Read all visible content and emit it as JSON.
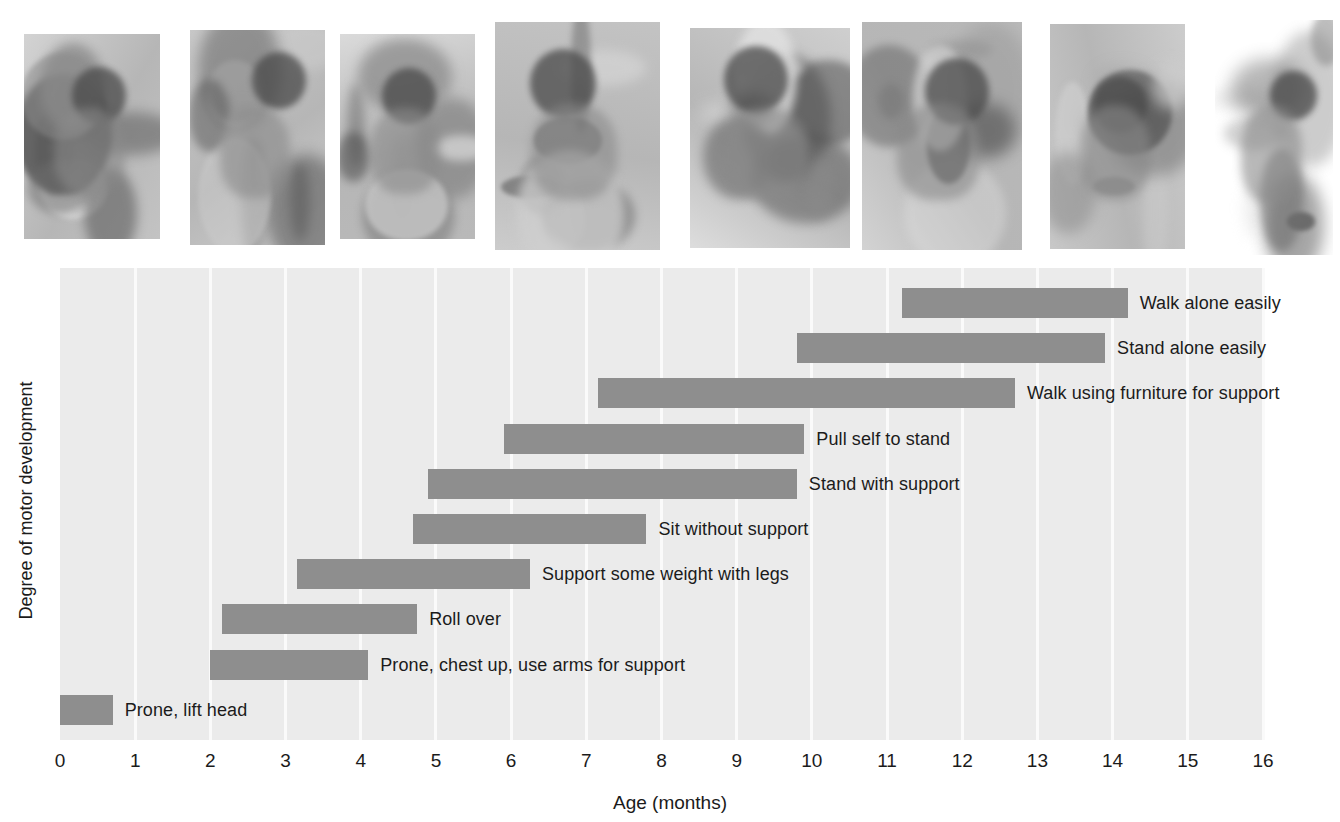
{
  "figure": {
    "x_axis_title": "Age (months)",
    "y_axis_title": "Degree of motor development"
  },
  "photos": [
    {
      "name": "photo-prone-lift-head",
      "alt": "Infant lying prone lifting head"
    },
    {
      "name": "photo-roll-over",
      "alt": "Infant rolling over"
    },
    {
      "name": "photo-support-weight-on-legs",
      "alt": "Infant on hands and feet supporting weight"
    },
    {
      "name": "photo-sit-without-support",
      "alt": "Infant sitting without support"
    },
    {
      "name": "photo-pull-self-to-stand",
      "alt": "Infant pulling self up on a stool"
    },
    {
      "name": "photo-stand-with-support",
      "alt": "Infant standing holding a curtain"
    },
    {
      "name": "photo-walk-with-help",
      "alt": "Infant walking with adult hands for support"
    },
    {
      "name": "photo-walk-alone",
      "alt": "Toddler walking alone"
    }
  ],
  "chart_data": {
    "type": "bar",
    "orientation": "horizontal-range",
    "title": "",
    "xlabel": "Age (months)",
    "ylabel": "Degree of motor development",
    "xlim": [
      0,
      16
    ],
    "ylim": [
      0,
      10
    ],
    "grid": true,
    "legend": "none",
    "bar_color": "#8e8e8e",
    "plot_background": "#ebebeb",
    "gridline_color": "#fafafa",
    "x_ticks": [
      0,
      1,
      2,
      3,
      4,
      5,
      6,
      7,
      8,
      9,
      10,
      11,
      12,
      13,
      14,
      15,
      16
    ],
    "x_tick_labels": [
      "0",
      "1",
      "2",
      "3",
      "4",
      "5",
      "6",
      "7",
      "8",
      "9",
      "10",
      "11",
      "12",
      "13",
      "14",
      "15",
      "16"
    ],
    "categories": [
      "Walk alone easily",
      "Stand alone easily",
      "Walk using furniture for support",
      "Pull self to stand",
      "Stand with support",
      "Sit without support",
      "Support some weight with legs",
      "Roll over",
      "Prone, chest up, use arms for support",
      "Prone, lift head"
    ],
    "bars": [
      {
        "label": "Walk alone easily",
        "start": 11.2,
        "end": 14.2
      },
      {
        "label": "Stand alone easily",
        "start": 9.8,
        "end": 13.9
      },
      {
        "label": "Walk using furniture for support",
        "start": 7.15,
        "end": 12.7
      },
      {
        "label": "Pull self to stand",
        "start": 5.9,
        "end": 9.9
      },
      {
        "label": "Stand with support",
        "start": 4.9,
        "end": 9.8
      },
      {
        "label": "Sit without support",
        "start": 4.7,
        "end": 7.8
      },
      {
        "label": "Support some weight with legs",
        "start": 3.15,
        "end": 6.25
      },
      {
        "label": "Roll over",
        "start": 2.15,
        "end": 4.75
      },
      {
        "label": "Prone, chest up, use arms for support",
        "start": 2.0,
        "end": 4.1
      },
      {
        "label": "Prone, lift head",
        "start": 0.0,
        "end": 0.7
      }
    ]
  }
}
